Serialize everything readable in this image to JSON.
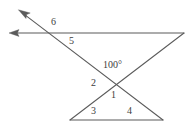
{
  "figure": {
    "line_color": "#5b5b5b",
    "label_color": "#3d3d3d",
    "background_color": "#ffffff",
    "width": 190,
    "height": 124
  },
  "labels": {
    "angle_6": "6",
    "angle_5": "5",
    "angle_measure": "100°",
    "angle_2": "2",
    "angle_1": "1",
    "angle_3": "3",
    "angle_4": "4"
  },
  "geometry": {
    "horizontal_ray": {
      "name": "horizontal-ray",
      "from": [
        184,
        33
      ],
      "to": [
        10,
        33
      ],
      "arrow_at": "to"
    },
    "falling_ray": {
      "name": "falling-transversal-ray",
      "from": [
        163,
        120
      ],
      "to": [
        19,
        10
      ],
      "arrow_at": "to"
    },
    "rising_line": {
      "name": "rising-transversal",
      "from": [
        70,
        120
      ],
      "to": [
        184,
        33
      ],
      "arrow_at": "none"
    },
    "triangle_base": {
      "name": "triangle-base",
      "from": [
        70,
        120
      ],
      "to": [
        163,
        120
      ],
      "arrow_at": "none"
    },
    "intersections": {
      "top_left": [
        52,
        33
      ],
      "center_x": [
        115,
        86
      ],
      "top_right": [
        184,
        33
      ],
      "base_left": [
        70,
        120
      ],
      "base_right": [
        163,
        120
      ]
    }
  },
  "label_positions": {
    "angle_6": [
      51,
      17
    ],
    "angle_5": [
      69,
      36
    ],
    "angle_measure": [
      103,
      60
    ],
    "angle_2": [
      91,
      78
    ],
    "angle_1": [
      111,
      90
    ],
    "angle_3": [
      91,
      106
    ],
    "angle_4": [
      127,
      106
    ]
  }
}
